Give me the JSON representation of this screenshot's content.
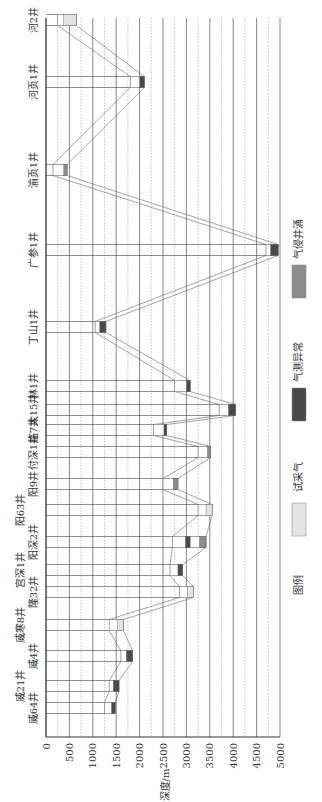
{
  "chart_data": {
    "type": "table",
    "title": "",
    "ylabel": "深度/m",
    "xlabel": "",
    "axis": {
      "depth_ticks": [
        0,
        500,
        1000,
        1500,
        2000,
        2500,
        3000,
        3500,
        4000,
        4500,
        5000
      ],
      "depth_range": [
        0,
        5000
      ],
      "grid": "solid lines every 500 m, dashed lines at intermediate 250 m offsets"
    },
    "legend": {
      "title": "图例",
      "items": [
        {
          "label": "试采气",
          "color": "#e3e3e3"
        },
        {
          "label": "气测异常",
          "color": "#4a4a4a"
        },
        {
          "label": "气侵井涌",
          "color": "#8c8c8c"
        }
      ]
    },
    "wells": [
      {
        "name": "威64井",
        "top_depth": 1250,
        "shows": [
          {
            "type": "气测异常",
            "from": 1400,
            "to": 1480
          }
        ]
      },
      {
        "name": "威21井",
        "top_depth": 1350,
        "shows": [
          {
            "type": "气测异常",
            "from": 1440,
            "to": 1560
          }
        ]
      },
      {
        "name": "威4井",
        "top_depth": 1600,
        "shows": [
          {
            "type": "气测异常",
            "from": 1720,
            "to": 1850
          }
        ]
      },
      {
        "name": "威寒8井",
        "top_depth": 1350,
        "shows": [
          {
            "type": "试采气",
            "from": 1520,
            "to": 1650
          }
        ]
      },
      {
        "name": "隆32井",
        "top_depth": 2850,
        "shows": [
          {
            "type": "试采气",
            "from": 3020,
            "to": 3150
          }
        ]
      },
      {
        "name": "宫深1井",
        "top_depth": 2650,
        "shows": [
          {
            "type": "气测异常",
            "from": 2820,
            "to": 2920
          }
        ]
      },
      {
        "name": "阳深2井",
        "top_depth": 2700,
        "shows": [
          {
            "type": "气测异常",
            "from": 2980,
            "to": 3080
          },
          {
            "type": "气侵井涌",
            "from": 3280,
            "to": 3420
          }
        ]
      },
      {
        "name": "阳63井",
        "top_depth": 3250,
        "shows": [
          {
            "type": "试采气",
            "from": 3420,
            "to": 3550
          }
        ]
      },
      {
        "name": "阳9井",
        "top_depth": 2500,
        "shows": [
          {
            "type": "气侵井涌",
            "from": 2720,
            "to": 2820
          }
        ]
      },
      {
        "name": "付深1井",
        "top_depth": 3250,
        "shows": [
          {
            "type": "气侵井涌",
            "from": 3450,
            "to": 3520
          }
        ]
      },
      {
        "name": "临7井",
        "top_depth": 2300,
        "shows": [
          {
            "type": "气测异常",
            "from": 2520,
            "to": 2580
          }
        ]
      },
      {
        "name": "太15井",
        "top_depth": 3700,
        "shows": [
          {
            "type": "气测异常",
            "from": 3900,
            "to": 4050
          }
        ]
      },
      {
        "name": "林1井",
        "top_depth": 2750,
        "shows": [
          {
            "type": "气测异常",
            "from": 3000,
            "to": 3080
          }
        ]
      },
      {
        "name": "丁山1井",
        "top_depth": 1050,
        "shows": [
          {
            "type": "气测异常",
            "from": 1150,
            "to": 1280
          }
        ]
      },
      {
        "name": "广参1井",
        "top_depth": 4700,
        "shows": [
          {
            "type": "气测异常",
            "from": 4800,
            "to": 4960
          }
        ]
      },
      {
        "name": "渝页1井",
        "top_depth": 150,
        "shows": [
          {
            "type": "气侵井涌",
            "from": 380,
            "to": 450
          }
        ]
      },
      {
        "name": "河页1井",
        "top_depth": 1800,
        "shows": [
          {
            "type": "气测异常",
            "from": 2000,
            "to": 2100
          }
        ]
      },
      {
        "name": "河2井",
        "top_depth": 250,
        "shows": [
          {
            "type": "试采气",
            "from": 380,
            "to": 650
          }
        ]
      }
    ]
  }
}
